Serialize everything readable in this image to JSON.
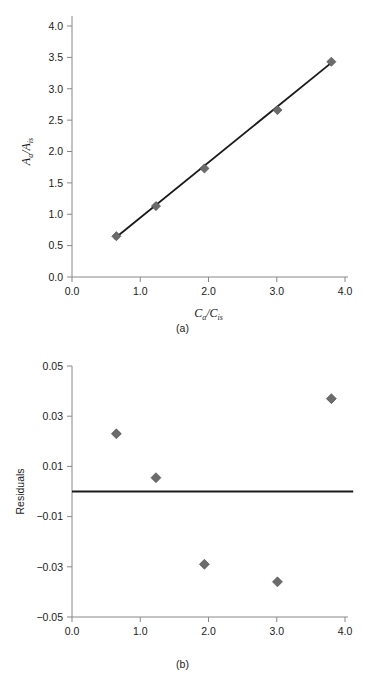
{
  "figure": {
    "caption_a": "(a)",
    "caption_b": "(b)",
    "marker_color": "#6b6b6b",
    "marker_edge_color": "#4a4a4a",
    "line_color": "#1a1a1a",
    "axis_color": "#888888"
  },
  "chart_data": [
    {
      "type": "scatter",
      "panel": "a",
      "title": "",
      "xlabel": "Ca/Cis",
      "xlabel_parts": {
        "base1": "C",
        "sub1": "a",
        "slash": "/",
        "base2": "C",
        "sub2": "is"
      },
      "ylabel": "Aa/Ais",
      "ylabel_parts": {
        "base1": "A",
        "sub1": "a",
        "slash": "/",
        "base2": "A",
        "sub2": "is"
      },
      "xlim": [
        0.0,
        4.0
      ],
      "ylim": [
        0.0,
        4.0
      ],
      "xticks": [
        "0.0",
        "1.0",
        "2.0",
        "3.0",
        "4.0"
      ],
      "xtick_values": [
        0.0,
        1.0,
        2.0,
        3.0,
        4.0
      ],
      "yticks": [
        "0.0",
        "0.5",
        "1.0",
        "1.5",
        "2.0",
        "2.5",
        "3.0",
        "3.5",
        "4.0"
      ],
      "ytick_values": [
        0.0,
        0.5,
        1.0,
        1.5,
        2.0,
        2.5,
        3.0,
        3.5,
        4.0
      ],
      "grid": false,
      "legend": false,
      "x": [
        0.65,
        1.23,
        1.94,
        3.01,
        3.8
      ],
      "y": [
        0.65,
        1.13,
        1.73,
        2.66,
        3.43
      ],
      "fit_line": {
        "x": [
          0.62,
          3.83
        ],
        "y": [
          0.61,
          3.44
        ]
      }
    },
    {
      "type": "scatter",
      "panel": "b",
      "title": "",
      "xlabel": "",
      "ylabel": "Residuals",
      "xlim": [
        0.0,
        4.0
      ],
      "ylim": [
        -0.05,
        0.05
      ],
      "xticks": [
        "0.0",
        "1.0",
        "2.0",
        "3.0",
        "4.0"
      ],
      "xtick_values": [
        0.0,
        1.0,
        2.0,
        3.0,
        4.0
      ],
      "yticks": [
        "0.05",
        "0.03",
        "0.01",
        "−0.01",
        "−0.03",
        "−0.05"
      ],
      "ytick_values": [
        0.05,
        0.03,
        0.01,
        -0.01,
        -0.03,
        -0.05
      ],
      "grid": false,
      "legend": false,
      "x": [
        0.65,
        1.23,
        1.94,
        3.01,
        3.8
      ],
      "y": [
        0.023,
        0.0055,
        -0.029,
        -0.036,
        0.037
      ],
      "zero_line": {
        "y": 0.0,
        "x": [
          0.0,
          4.12
        ]
      }
    }
  ]
}
